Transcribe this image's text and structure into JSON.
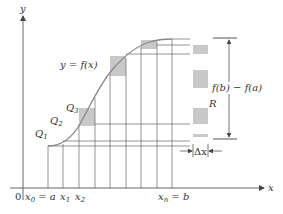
{
  "diagram": {
    "axes": {
      "x_label": "x",
      "y_label": "y",
      "origin_label": "0"
    },
    "curve_label": "y = f(x)",
    "points": [
      {
        "name": "Q",
        "sub": "1"
      },
      {
        "name": "Q",
        "sub": "2"
      },
      {
        "name": "Q",
        "sub": "3"
      }
    ],
    "x_ticks": {
      "x0": {
        "main": "x",
        "sub": "0",
        "rest": " = a"
      },
      "x1": {
        "main": "x",
        "sub": "1"
      },
      "x2": {
        "main": "x",
        "sub": "2"
      },
      "xn": {
        "main": "x",
        "sub": "n",
        "rest": " = b"
      }
    },
    "height_label": "f(b) − f(a)",
    "region_label": "R",
    "width_label": "Δx",
    "colors": {
      "axis": "#555555",
      "curve": "#808080",
      "shade": "#c8c8c8",
      "grid": "#666666"
    }
  }
}
